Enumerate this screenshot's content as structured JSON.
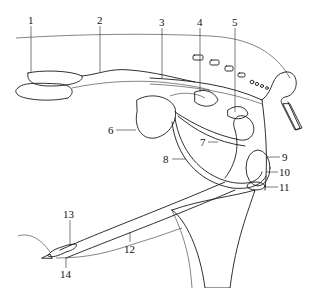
{
  "diagram": {
    "type": "anatomical-line-drawing",
    "style": "black ink on white, stippled shading",
    "colors": {
      "ink": "#1a1a1a",
      "background": "#ffffff",
      "stipple": "#555555"
    },
    "labels": [
      {
        "id": 1,
        "text": "1",
        "x": 28,
        "y": 24
      },
      {
        "id": 2,
        "text": "2",
        "x": 97,
        "y": 24
      },
      {
        "id": 3,
        "text": "3",
        "x": 159,
        "y": 26
      },
      {
        "id": 4,
        "text": "4",
        "x": 197,
        "y": 26
      },
      {
        "id": 5,
        "text": "5",
        "x": 232,
        "y": 26
      },
      {
        "id": 6,
        "text": "6",
        "x": 108,
        "y": 133
      },
      {
        "id": 7,
        "text": "7",
        "x": 200,
        "y": 145
      },
      {
        "id": 8,
        "text": "8",
        "x": 163,
        "y": 162
      },
      {
        "id": 9,
        "text": "9",
        "x": 282,
        "y": 160
      },
      {
        "id": 10,
        "text": "10",
        "x": 280,
        "y": 175
      },
      {
        "id": 11,
        "text": "11",
        "x": 280,
        "y": 190
      },
      {
        "id": 12,
        "text": "12",
        "x": 126,
        "y": 253
      },
      {
        "id": 13,
        "text": "13",
        "x": 64,
        "y": 218
      },
      {
        "id": 14,
        "text": "14",
        "x": 62,
        "y": 277
      }
    ]
  }
}
